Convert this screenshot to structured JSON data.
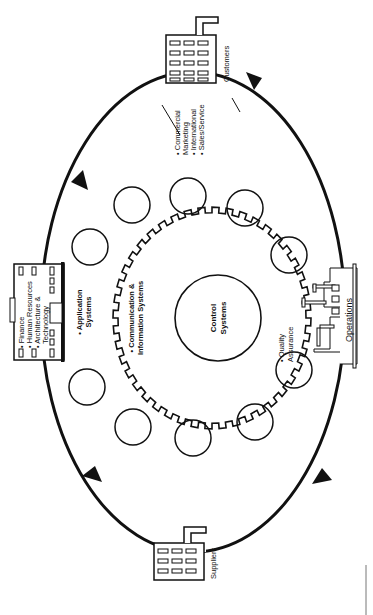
{
  "diagram": {
    "orientation": "rotated-90-clockwise",
    "center": {
      "label_line1": "Control",
      "label_line2": "Systems"
    },
    "ring": {
      "label_line1": "• Communication &",
      "label_line2": "Information Systems"
    },
    "application": {
      "label_line1": "• Application",
      "label_line2": "Systems"
    },
    "quality": {
      "label_line1": "• Quality",
      "label_line2": "Assurance"
    },
    "headquarters": {
      "items": [
        "• Finance",
        "• Human Resources",
        "• Architecture &",
        "  Technology"
      ]
    },
    "customers": {
      "label": "Customers",
      "functions": [
        "• Commercial",
        "  Marketing",
        "• International",
        "• Sales/Service"
      ]
    },
    "suppliers": {
      "label": "Suppliers"
    },
    "operations": {
      "label": "Operations"
    },
    "colors": {
      "line": "#111111",
      "background": "#ffffff"
    }
  }
}
